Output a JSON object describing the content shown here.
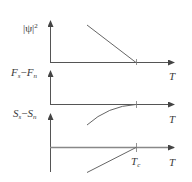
{
  "figure": {
    "colors": {
      "axis": "#555555",
      "curve": "#666666",
      "text": "#3a3a3a",
      "background": "#ffffff"
    },
    "panels": [
      {
        "id": "order-parameter",
        "ylabel": {
          "main": "|ψ|",
          "sup": "2"
        },
        "xlabel": "T",
        "curve": "linear decreasing to zero at Tc"
      },
      {
        "id": "free-energy",
        "ylabel": {
          "a": "F",
          "a_sub": "s",
          "minus": "−",
          "b": "F",
          "b_sub": "n"
        },
        "xlabel": "T",
        "curve": "parabolic rising to zero at Tc"
      },
      {
        "id": "entropy",
        "ylabel": {
          "a": "S",
          "a_sub": "s",
          "minus": "−",
          "b": "S",
          "b_sub": "n"
        },
        "xlabel": "T",
        "tick_label": {
          "main": "T",
          "sub": "c"
        },
        "curve": "linear rising to zero at Tc"
      }
    ]
  }
}
